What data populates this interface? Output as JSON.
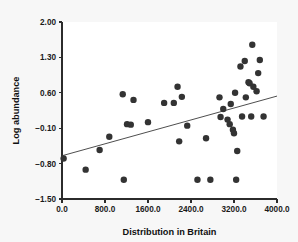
{
  "chart_data": {
    "type": "scatter",
    "title": "",
    "xlabel": "Distribution in Britain",
    "ylabel": "Log abundance",
    "xlim": [
      0,
      4000
    ],
    "ylim": [
      -1.5,
      2.0
    ],
    "grid": false,
    "legend": null,
    "xticks": [
      0,
      800,
      1600,
      2400,
      3200,
      4000
    ],
    "xtick_labels": [
      "0.0",
      "800.0",
      "1600.0",
      "2400.0",
      "3200.0",
      "4000.0"
    ],
    "yticks": [
      -1.5,
      -0.8,
      -0.1,
      0.6,
      1.3,
      2.0
    ],
    "ytick_labels": [
      "-1.50",
      "-0.80",
      "-0.10",
      "0.60",
      "1.30",
      "2.00"
    ],
    "marker": {
      "shape": "circle",
      "color": "#333333",
      "size": 3.2
    },
    "points": [
      {
        "x": 30,
        "y": -0.7
      },
      {
        "x": 440,
        "y": -0.92
      },
      {
        "x": 700,
        "y": -0.53
      },
      {
        "x": 880,
        "y": -0.27
      },
      {
        "x": 1130,
        "y": 0.57
      },
      {
        "x": 1150,
        "y": -1.12
      },
      {
        "x": 1210,
        "y": -0.02
      },
      {
        "x": 1280,
        "y": -0.03
      },
      {
        "x": 1330,
        "y": 0.46
      },
      {
        "x": 1600,
        "y": 0.02
      },
      {
        "x": 1900,
        "y": 0.4
      },
      {
        "x": 2080,
        "y": 0.4
      },
      {
        "x": 2150,
        "y": 0.72
      },
      {
        "x": 2180,
        "y": -0.36
      },
      {
        "x": 2230,
        "y": 0.52
      },
      {
        "x": 2330,
        "y": -0.05
      },
      {
        "x": 2520,
        "y": -1.12
      },
      {
        "x": 2680,
        "y": -0.3
      },
      {
        "x": 2760,
        "y": -1.12
      },
      {
        "x": 2930,
        "y": 0.51
      },
      {
        "x": 2950,
        "y": 0.12
      },
      {
        "x": 3000,
        "y": 0.28
      },
      {
        "x": 3080,
        "y": 0.07
      },
      {
        "x": 3120,
        "y": -0.02
      },
      {
        "x": 3140,
        "y": 0.38
      },
      {
        "x": 3180,
        "y": -0.13
      },
      {
        "x": 3200,
        "y": -0.2
      },
      {
        "x": 3220,
        "y": 0.6
      },
      {
        "x": 3240,
        "y": -1.12
      },
      {
        "x": 3260,
        "y": -0.55
      },
      {
        "x": 3320,
        "y": 1.12
      },
      {
        "x": 3350,
        "y": 0.13
      },
      {
        "x": 3400,
        "y": 1.23
      },
      {
        "x": 3420,
        "y": 0.51
      },
      {
        "x": 3470,
        "y": 0.81
      },
      {
        "x": 3490,
        "y": 0.79
      },
      {
        "x": 3520,
        "y": 0.13
      },
      {
        "x": 3540,
        "y": 1.55
      },
      {
        "x": 3560,
        "y": 0.72
      },
      {
        "x": 3620,
        "y": 0.63
      },
      {
        "x": 3650,
        "y": 0.99
      },
      {
        "x": 3680,
        "y": 1.25
      },
      {
        "x": 3750,
        "y": 0.13
      }
    ],
    "fit_line": {
      "type": "linear-regression",
      "x_start": 0,
      "y_start": -0.645,
      "x_end": 4000,
      "y_end": 0.535
    }
  }
}
